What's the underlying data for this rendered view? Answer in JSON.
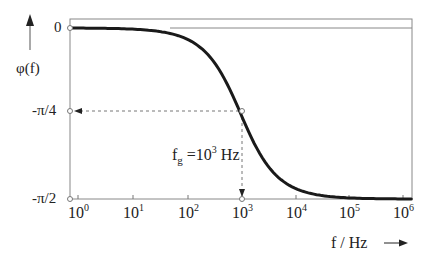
{
  "chart_data": {
    "type": "line",
    "title": "",
    "xlabel": "f / Hz",
    "ylabel": "φ(f)",
    "xscale": "log",
    "xlim": [
      1,
      1000000
    ],
    "ylim": [
      "-π/2",
      "0"
    ],
    "ylim_numeric": [
      -1.5708,
      0
    ],
    "x_ticks": [
      "10^0",
      "10^1",
      "10^2",
      "10^3",
      "10^4",
      "10^5",
      "10^6"
    ],
    "y_ticks": [
      "0",
      "-π/4",
      "-π/2"
    ],
    "grid": false,
    "legend": null,
    "series": [
      {
        "name": "φ(f) = -arctan(f / f_g)",
        "x": [
          1,
          10,
          100,
          1000,
          10000,
          100000,
          1000000
        ],
        "values": [
          -0.001,
          -0.01,
          -0.0997,
          -0.7854,
          -1.4711,
          -1.5608,
          -1.5698
        ]
      }
    ],
    "annotations": [
      {
        "text": "f_g = 10^3 Hz",
        "x": 1000,
        "y": -0.7854,
        "type": "dashed-crosshair",
        "marker": "open-circle"
      }
    ]
  },
  "labels": {
    "y_axis": "φ(f)",
    "x_axis": "f / Hz",
    "y_tick_0": "0",
    "y_tick_pi4": "-π/4",
    "y_tick_pi2": "-π/2",
    "x_tick_base": "10",
    "x_tick_exps": [
      "0",
      "1",
      "2",
      "3",
      "4",
      "5",
      "6"
    ],
    "fg_prefix": "f",
    "fg_sub": "g",
    "fg_mid": " =10",
    "fg_exp": "3",
    "fg_unit": " Hz"
  },
  "colors": {
    "curve": "#1a1a1a",
    "axis": "#777777",
    "text": "#222222"
  }
}
